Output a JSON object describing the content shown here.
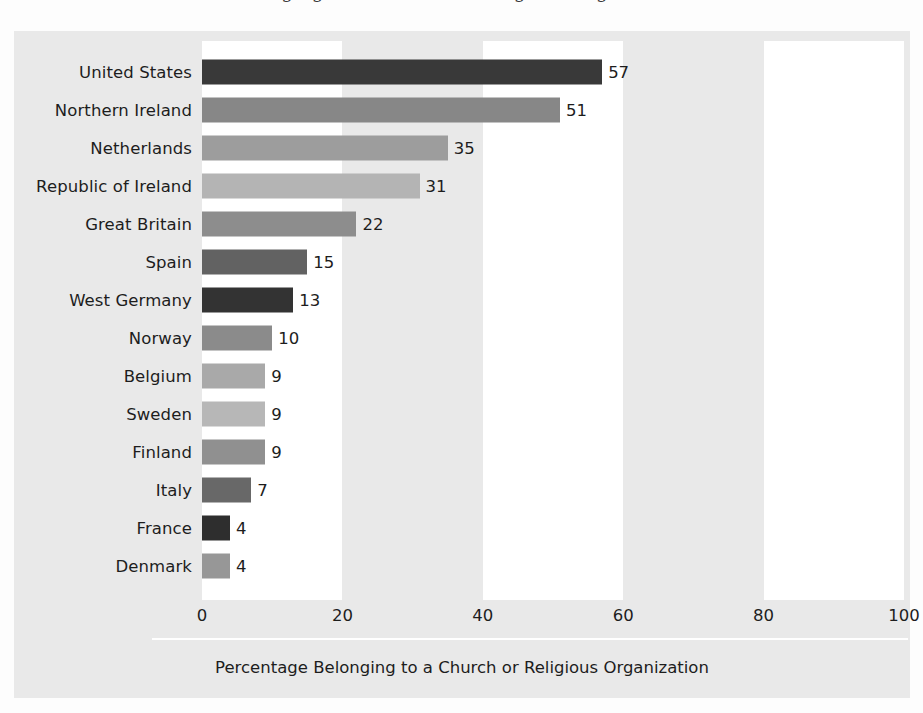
{
  "page": {
    "clipped_heading": "Belonging to a Church or Religious Organization"
  },
  "axis": {
    "title": "Percentage Belonging to a Church or Religious Organization",
    "ticks": [
      "0",
      "20",
      "40",
      "60",
      "80",
      "100"
    ]
  },
  "colors": {
    "panel_background": "#e9e9e9",
    "band_background": "#ffffff",
    "text": "#1d1d1d"
  },
  "chart_data": {
    "type": "bar",
    "orientation": "horizontal",
    "title": "Percentage Belonging to a Church or Religious Organization",
    "xlabel": "Percentage Belonging to a Church or Religious Organization",
    "ylabel": "",
    "xlim": [
      0,
      100
    ],
    "xticks": [
      0,
      20,
      40,
      60,
      80,
      100
    ],
    "grid": false,
    "legend": "none",
    "bar_value_labels": true,
    "categories": [
      "United States",
      "Northern Ireland",
      "Netherlands",
      "Republic of Ireland",
      "Great Britain",
      "Spain",
      "West Germany",
      "Norway",
      "Belgium",
      "Sweden",
      "Finland",
      "Italy",
      "France",
      "Denmark"
    ],
    "values": [
      57,
      51,
      35,
      31,
      22,
      15,
      13,
      10,
      9,
      9,
      9,
      7,
      4,
      4
    ],
    "bar_colors": [
      "#393939",
      "#878787",
      "#9d9d9d",
      "#b4b4b4",
      "#8d8d8d",
      "#626262",
      "#333333",
      "#8b8b8b",
      "#a9a9a9",
      "#b7b7b7",
      "#909090",
      "#686868",
      "#2e2e2e",
      "#979797"
    ]
  }
}
